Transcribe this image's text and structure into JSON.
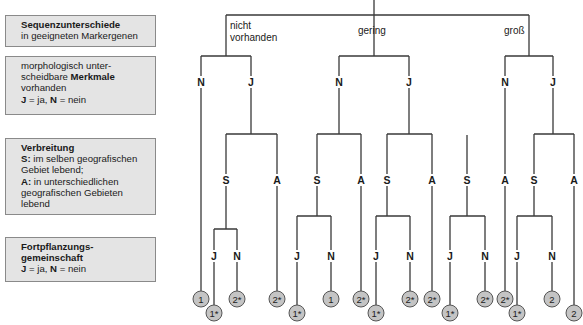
{
  "legend": {
    "sequence": {
      "title": "Sequenzunterschiede",
      "text": "in geeigneten Markergenen"
    },
    "morphology": {
      "line1": "morphologisch unter-",
      "line2_pre": "scheidbare ",
      "line2_bold": "Merkmale",
      "line3": "vorhanden",
      "key_j": "J",
      "key_j_text": " = ja, ",
      "key_n": "N",
      "key_n_text": " = nein"
    },
    "distribution": {
      "title": "Verbreitung",
      "s_key": "S:",
      "s_text": " im selben geografischen Gebiet lebend;",
      "a_key": "A:",
      "a_text": " in unterschiedlichen geografischen Gebieten lebend"
    },
    "reproduction": {
      "title_line1": "Fortpflanzungs-",
      "title_line2": "gemeinschaft",
      "key_j": "J",
      "key_j_text": " = ja,  ",
      "key_n": "N",
      "key_n_text": " = nein"
    }
  },
  "tree": {
    "level1_labels": {
      "none_line1": "nicht",
      "none_line2": "vorhanden",
      "low": "gering",
      "high": "groß"
    },
    "level2_labels": {
      "n": "N",
      "j": "J"
    },
    "level3_labels": {
      "s": "S",
      "a": "A"
    },
    "level4_labels": {
      "j": "J",
      "n": "N"
    },
    "leaves": [
      "1",
      "1*",
      "2*",
      "2*",
      "1*",
      "1",
      "2*",
      "1*",
      "2*",
      "2*",
      "1*",
      "2*",
      "2*",
      "1*",
      "2",
      "2"
    ]
  }
}
